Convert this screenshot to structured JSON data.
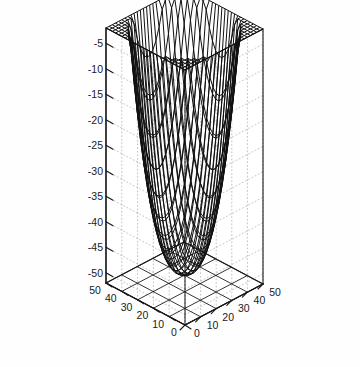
{
  "figure": {
    "type": "3d-mesh-surface-plot",
    "background_color": "#fefefe",
    "line_color": "#111111",
    "grid_color": "#9a9a9a",
    "axis_color": "#1a1a1a"
  },
  "chart_data": {
    "type": "surface",
    "title": "",
    "subtitle": "",
    "xlabel": "",
    "ylabel": "",
    "zlabel": "",
    "projection": "3d-wireframe-mesh",
    "grid": true,
    "legend": false,
    "legend_position": "none",
    "x": {
      "min": 0,
      "max": 50,
      "ticks": [
        0,
        10,
        20,
        30,
        40,
        50
      ],
      "tick_labels": [
        "0",
        "10",
        "20",
        "30",
        "40",
        "50"
      ],
      "n_mesh": 25
    },
    "y": {
      "min": 0,
      "max": 50,
      "ticks": [
        0,
        10,
        20,
        30,
        40,
        50
      ],
      "tick_labels": [
        "0",
        "10",
        "20",
        "30",
        "40",
        "50"
      ],
      "n_mesh": 25
    },
    "z": {
      "min": -50,
      "max": -2,
      "ticks": [
        -5,
        -10,
        -15,
        -20,
        -25,
        -30,
        -35,
        -40,
        -45,
        -50
      ],
      "tick_labels": [
        "-5",
        "-10",
        "-15",
        "-20",
        "-25",
        "-30",
        "-35",
        "-40",
        "-45",
        "-50"
      ],
      "zlim": [
        -52,
        -2
      ]
    },
    "surface_model": {
      "description": "bowl / inverted paraboloid, minimum at domain center, rising to rim",
      "formula": "z = zmin + (zmax - zmin) * ((r/rmax)^p)",
      "center_x": 25,
      "center_y": 25,
      "z_center": -50,
      "z_rim": -2,
      "exponent": 2.6,
      "radial_norm": 1.0
    },
    "camera": {
      "azimuth_deg": -37.5,
      "elevation_deg": 30,
      "box_apex_top_px": [
        205,
        13
      ],
      "box_corner_left_px": [
        38,
        70
      ],
      "box_corner_right_px": [
        330,
        88
      ],
      "box_vertex_bottom_px": [
        185,
        325
      ]
    }
  },
  "axes": {
    "z_axis": {
      "name": "z-axis",
      "position": "left-vertical",
      "labels": [
        "-5",
        "-10",
        "-15",
        "-20",
        "-25",
        "-30",
        "-35",
        "-40",
        "-45",
        "-50"
      ]
    },
    "y_axis": {
      "name": "y-axis",
      "position": "bottom-left-oblique",
      "labels": [
        "50",
        "40",
        "30",
        "20",
        "10",
        "0"
      ]
    },
    "x_axis": {
      "name": "x-axis",
      "position": "bottom-right-oblique",
      "labels": [
        "0",
        "10",
        "20",
        "30",
        "40",
        "50"
      ]
    }
  }
}
